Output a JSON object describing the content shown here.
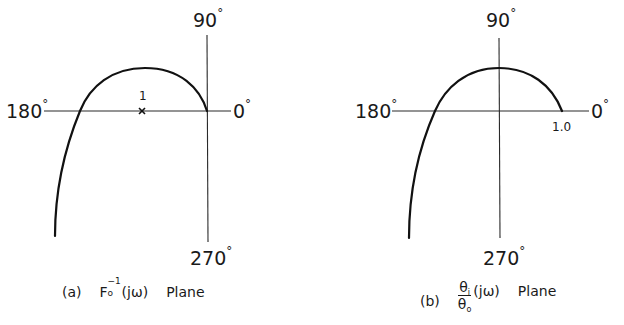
{
  "figure": {
    "panels": [
      {
        "id": "a",
        "caption": {
          "tag": "(a)",
          "function_base": "F",
          "function_sub": "o",
          "function_sup": "−1",
          "function_arg": "(jω)",
          "word": "Plane"
        },
        "axis_labels": {
          "top": "90",
          "left": "180",
          "right": "0",
          "bottom": "270",
          "degree_symbol": "°"
        },
        "marker": {
          "symbol": "×",
          "label": "1"
        }
      },
      {
        "id": "b",
        "caption": {
          "tag": "(b)",
          "numerator_base": "θ",
          "numerator_sub": "i",
          "denominator_base": "θ",
          "denominator_sub": "o",
          "function_arg": "(jω)",
          "word": "Plane"
        },
        "axis_labels": {
          "top": "90",
          "left": "180",
          "right": "0",
          "bottom": "270",
          "degree_symbol": "°"
        },
        "point_label": "1.0"
      }
    ]
  }
}
